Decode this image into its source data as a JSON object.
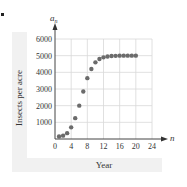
{
  "chart_data": {
    "type": "scatter",
    "title": "",
    "xlabel": "Year",
    "ylabel": "Insects per acre",
    "x_axis_var": "n",
    "y_axis_var": "a_n",
    "x_ticks": [
      0,
      4,
      8,
      12,
      16,
      20,
      24
    ],
    "y_ticks": [
      1000,
      2000,
      3000,
      4000,
      5000,
      6000
    ],
    "xlim": [
      0,
      24
    ],
    "ylim": [
      0,
      6000
    ],
    "grid": true,
    "legend": null,
    "series": [
      {
        "name": "a_n",
        "color": "#6b6b6b",
        "x": [
          1,
          2,
          3,
          4,
          5,
          6,
          7,
          8,
          9,
          10,
          11,
          12,
          13,
          14,
          15,
          16,
          17,
          18,
          19,
          20
        ],
        "values": [
          150,
          200,
          350,
          700,
          1250,
          2000,
          2850,
          3650,
          4200,
          4600,
          4800,
          4900,
          4950,
          4980,
          4990,
          5000,
          5000,
          5000,
          5000,
          5000
        ]
      }
    ]
  },
  "labels": {
    "xlabel": "Year",
    "ylabel": "Insects per acre",
    "x_var": "n",
    "y_var_base": "a",
    "y_var_sub": "n"
  }
}
